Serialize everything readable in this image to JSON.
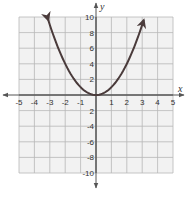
{
  "chart_data": {
    "type": "line",
    "title": "",
    "xlabel": "x",
    "ylabel": "y",
    "xlim": [
      -5,
      5
    ],
    "ylim": [
      -10,
      10
    ],
    "grid": true,
    "x_ticks": [
      -5,
      -4,
      -3,
      -2,
      -1,
      1,
      2,
      3,
      4,
      5
    ],
    "y_ticks": [
      10,
      8,
      6,
      4,
      2,
      -2,
      -4,
      -6,
      -8,
      -10
    ],
    "x_tick_labels": [
      "-5",
      "-4",
      "-3",
      "-2",
      "-1",
      "1",
      "2",
      "3",
      "4",
      "5"
    ],
    "y_tick_labels": [
      "10",
      "8",
      "6",
      "4",
      "2",
      "2",
      "-4",
      "-6",
      "-8",
      "-10"
    ],
    "series": [
      {
        "name": "y = x^2",
        "function": "x^2",
        "x": [
          -3.1,
          -3,
          -2,
          -1,
          0,
          1,
          2,
          3,
          3.1
        ],
        "y": [
          9.61,
          9,
          4,
          1,
          0,
          1,
          4,
          9,
          9.61
        ],
        "arrows_at_ends": true,
        "color": "#4a3b3b"
      }
    ]
  },
  "colors": {
    "grid_fill": "#f2f2f2",
    "grid_line": "#b8b8b8",
    "axis": "#555555",
    "curve": "#4a3b3b"
  }
}
